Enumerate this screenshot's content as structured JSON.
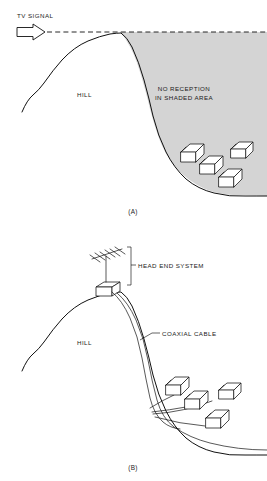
{
  "figure": {
    "colors": {
      "shade_fill": "#d4d4d4",
      "line": "#111111",
      "background": "#ffffff",
      "house_fill": "#ffffff"
    }
  },
  "panel_a": {
    "caption": "(A)",
    "signal_label": "TV SIGNAL",
    "hill_label": "HILL",
    "shadow_label_line1": "NO RECEPTION",
    "shadow_label_line2": "IN SHADED AREA",
    "house_count": 4,
    "signal_path": "dashed horizontal ray grazing hilltop",
    "arrow": "open outline arrow pointing right"
  },
  "panel_b": {
    "caption": "(B)",
    "head_end_label": "HEAD END SYSTEM",
    "hill_label": "HILL",
    "cable_label": "COAXIAL CABLE",
    "house_count": 4,
    "antenna": "yagi-antenna on mast",
    "equipment": "head end equipment box at hilltop",
    "cable_path": "twin-line coaxial trunk down the hill with drops to houses"
  }
}
